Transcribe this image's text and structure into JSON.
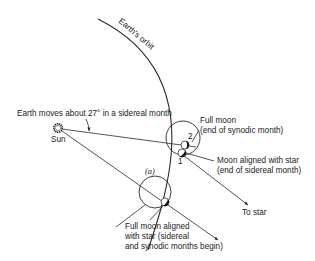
{
  "diagram": {
    "orbit_label": "Earth's orbit",
    "sun_label": "Sun",
    "earth_motion_label": "Earth moves about 27° in a sidereal month",
    "position_a_label": "(a)",
    "moon_positions": [
      {
        "id": "1",
        "label": "1"
      },
      {
        "id": "2",
        "label": "2"
      }
    ],
    "annotations": {
      "full_moon_end": {
        "line1": "Full moon",
        "line2": "(end of synodic month)"
      },
      "moon_aligned_end": {
        "line1": "Moon aligned with star",
        "line2": "(end of sidereal month)"
      },
      "to_star": "To star",
      "start": {
        "line1": "Full moon aligned",
        "line2": "with star (sidereal",
        "line3": "and synodic months begin)"
      }
    },
    "colors": {
      "ink": "#2a2a2a",
      "background": "#ffffff"
    }
  }
}
